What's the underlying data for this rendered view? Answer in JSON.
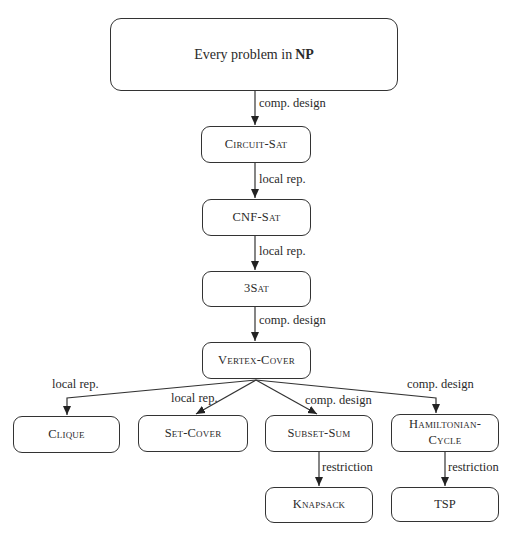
{
  "diagram": {
    "type": "reduction-tree",
    "root": {
      "text_prefix": "Every problem in",
      "text_bold": "NP"
    },
    "nodes": {
      "circuit_sat": "Circuit-Sat",
      "cnf_sat": "CNF-Sat",
      "three_sat": "3Sat",
      "vertex_cover": "Vertex-Cover",
      "clique": "Clique",
      "set_cover": "Set-Cover",
      "subset_sum": "Subset-Sum",
      "hamiltonian_line1": "Hamiltonian-",
      "hamiltonian_line2": "Cycle",
      "knapsack": "Knapsack",
      "tsp": "TSP"
    },
    "edges": [
      {
        "from": "root",
        "to": "circuit_sat",
        "label": "comp. design"
      },
      {
        "from": "circuit_sat",
        "to": "cnf_sat",
        "label": "local rep."
      },
      {
        "from": "cnf_sat",
        "to": "three_sat",
        "label": "local rep."
      },
      {
        "from": "three_sat",
        "to": "vertex_cover",
        "label": "comp. design"
      },
      {
        "from": "vertex_cover",
        "to": "clique",
        "label": "local rep."
      },
      {
        "from": "vertex_cover",
        "to": "set_cover",
        "label": "local rep."
      },
      {
        "from": "vertex_cover",
        "to": "subset_sum",
        "label": "comp. design"
      },
      {
        "from": "vertex_cover",
        "to": "hamiltonian_cycle",
        "label": "comp. design"
      },
      {
        "from": "subset_sum",
        "to": "knapsack",
        "label": "restriction"
      },
      {
        "from": "hamiltonian_cycle",
        "to": "tsp",
        "label": "restriction"
      }
    ]
  }
}
